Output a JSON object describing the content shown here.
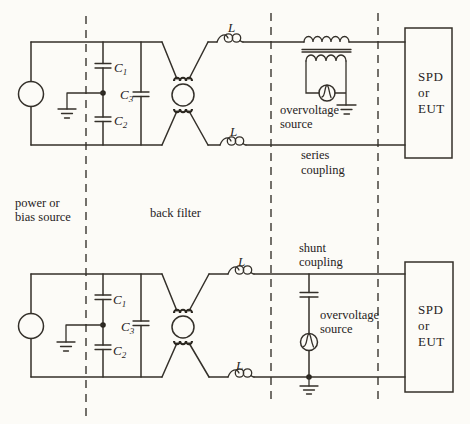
{
  "figure": {
    "background": "#fcfbf7",
    "line_color": "#34302a",
    "text_color": "#27231d"
  },
  "labels": {
    "source": [
      "power or",
      "bias source"
    ],
    "back_filter": "back filter",
    "series_coupling": [
      "series",
      "coupling"
    ],
    "shunt_coupling": [
      "shunt",
      "coupling"
    ],
    "overvoltage_source": [
      "overvoltage",
      "source"
    ],
    "load_box": [
      "SPD",
      "or",
      "EUT"
    ],
    "inductor": "L",
    "cap1_base": "C",
    "cap1_sub": "1",
    "cap2_base": "C",
    "cap2_sub": "2",
    "cap3_base": "C",
    "cap3_sub": "3"
  }
}
